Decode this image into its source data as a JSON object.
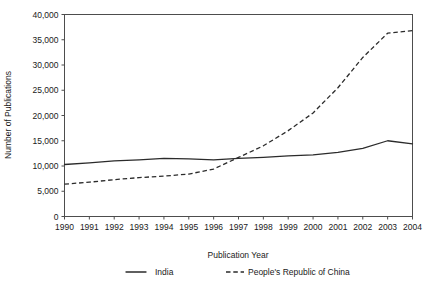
{
  "chart_data": {
    "type": "line",
    "title": "",
    "xlabel": "Publication Year",
    "ylabel": "Number of Publications",
    "x": [
      1990,
      1991,
      1992,
      1993,
      1994,
      1995,
      1996,
      1997,
      1998,
      1999,
      2000,
      2001,
      2002,
      2003,
      2004
    ],
    "xticklabels": [
      "1990",
      "1991",
      "1992",
      "1993",
      "1994",
      "1995",
      "1996",
      "1997",
      "1998",
      "1999",
      "2000",
      "2001",
      "2002",
      "2003",
      "2004"
    ],
    "yticklabels": [
      "0",
      "5,000",
      "10,000",
      "15,000",
      "20,000",
      "25,000",
      "30,000",
      "35,000",
      "40,000"
    ],
    "ytickvalues": [
      0,
      5000,
      10000,
      15000,
      20000,
      25000,
      30000,
      35000,
      40000
    ],
    "xlim": [
      1990,
      2004
    ],
    "ylim": [
      0,
      40000
    ],
    "grid": false,
    "legend_position": "bottom",
    "series": [
      {
        "name": "India",
        "style": "solid",
        "color": "#2b2b2b",
        "values": [
          10300,
          10600,
          11000,
          11200,
          11500,
          11400,
          11200,
          11500,
          11700,
          12000,
          12200,
          12700,
          13500,
          15000,
          14400
        ]
      },
      {
        "name": "People's Republic of China",
        "style": "dashed",
        "color": "#2b2b2b",
        "values": [
          6400,
          6800,
          7300,
          7700,
          8000,
          8400,
          9400,
          11700,
          14000,
          17000,
          20500,
          25500,
          31500,
          36300,
          36800
        ]
      }
    ]
  },
  "legend": {
    "entries": [
      {
        "label": "India"
      },
      {
        "label": "People's Republic of China"
      }
    ]
  }
}
